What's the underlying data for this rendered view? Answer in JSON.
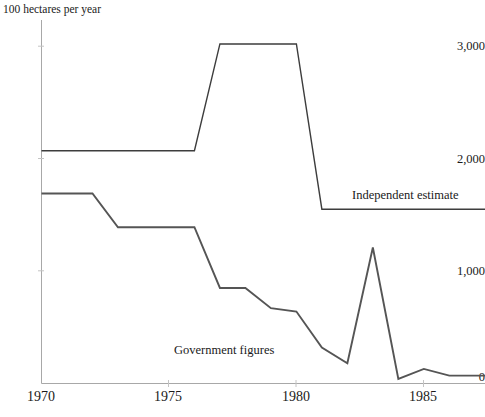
{
  "chart_data": {
    "type": "line",
    "title": "100 hectares per year",
    "xlabel": "",
    "ylabel": "100 hectares per year",
    "xlim": [
      1970,
      1987.4
    ],
    "ylim": [
      0,
      3150
    ],
    "xticks": [
      1970,
      1975,
      1980,
      1985
    ],
    "xtick_labels": [
      "1970",
      "1975",
      "1980",
      "1985"
    ],
    "yticks": [
      0,
      1000,
      2000,
      3000
    ],
    "ytick_labels": [
      "0",
      "1,000",
      "2,000",
      "3,000"
    ],
    "grid": false,
    "legend": "inline-annotations",
    "series": [
      {
        "name": "Independent estimate",
        "label_position": "right-inline",
        "color": "#3d3d3d",
        "x": [
          1970.0,
          1976.0,
          1977.0,
          1980.0,
          1981.0,
          1987.4
        ],
        "values": [
          2070,
          2070,
          3020,
          3020,
          1550,
          1550
        ]
      },
      {
        "name": "Government figures",
        "label_position": "mid-inline",
        "color": "#555555",
        "x": [
          1970.0,
          1972.0,
          1973.0,
          1976.0,
          1977.0,
          1978.0,
          1979.0,
          1980.0,
          1981.0,
          1982.0,
          1983.0,
          1984.0,
          1985.0,
          1986.0,
          1987.4
        ],
        "values": [
          1690,
          1690,
          1390,
          1390,
          850,
          850,
          670,
          640,
          320,
          180,
          1210,
          40,
          130,
          70,
          70
        ]
      }
    ],
    "annotations": [
      {
        "text": "Independent estimate",
        "x": 1984.0,
        "y": 1720
      },
      {
        "text": "Government figures",
        "x": 1976.6,
        "y": 270
      }
    ]
  },
  "axes": {
    "title": "100 hectares per year",
    "y_labels": [
      "3,000",
      "2,000",
      "1,000",
      "0"
    ],
    "x_labels": [
      "1970",
      "1975",
      "1980",
      "1985"
    ]
  },
  "labels": {
    "independent": "Independent estimate",
    "government": "Government figures"
  },
  "colors": {
    "background": "#ffffff",
    "axis": "#9a9a9a",
    "independent_line": "#3d3d3d",
    "government_line": "#555555",
    "text": "#1a1a1a"
  }
}
